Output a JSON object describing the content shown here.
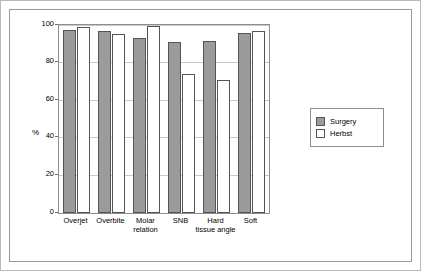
{
  "chart_data": {
    "type": "bar",
    "title": "",
    "xlabel": "",
    "ylabel": "%",
    "ylim": [
      0,
      100
    ],
    "yticks": [
      0,
      20,
      40,
      60,
      80,
      100
    ],
    "grid": true,
    "legend_position": "right",
    "categories": [
      "Overjet",
      "Overbite",
      "Molar relation",
      "SNB",
      "Hard tissue angle",
      "Soft"
    ],
    "category_lines": [
      [
        "Overjet"
      ],
      [
        "Overbite"
      ],
      [
        "Molar",
        "relation"
      ],
      [
        "SNB"
      ],
      [
        "Hard",
        "tissue angle"
      ],
      [
        "Soft",
        ""
      ]
    ],
    "series": [
      {
        "name": "Surgery",
        "color": "#9b9b9b",
        "values": [
          97.5,
          97,
          93,
          91,
          91.5,
          96
        ]
      },
      {
        "name": "Herbst",
        "color": "#ffffff",
        "values": [
          99,
          95,
          99.5,
          74,
          70.5,
          97
        ]
      }
    ]
  },
  "legend": {
    "items": [
      {
        "label": "Surgery"
      },
      {
        "label": "Herbst"
      }
    ]
  }
}
